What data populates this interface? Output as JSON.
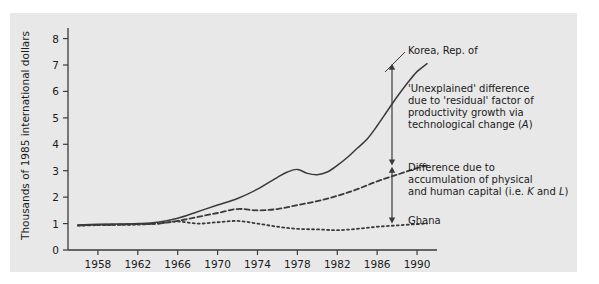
{
  "figure": {
    "background": "#ffffff",
    "panel_color": "#e8e8e8",
    "line_color": "#3a3a3a"
  },
  "chart_data": {
    "type": "line",
    "title": "",
    "xlabel": "",
    "ylabel": "Thousands of 1985 international dollars",
    "xlim": [
      1955,
      1992
    ],
    "ylim": [
      0,
      8.4
    ],
    "xticks": [
      "1958",
      "1962",
      "1966",
      "1970",
      "1974",
      "1978",
      "1982",
      "1986",
      "1990"
    ],
    "xtick_values": [
      1958,
      1962,
      1966,
      1970,
      1974,
      1978,
      1982,
      1986,
      1990
    ],
    "yticks": [
      "0",
      "1",
      "2",
      "3",
      "4",
      "5",
      "6",
      "7",
      "8"
    ],
    "ytick_values": [
      0,
      1,
      2,
      3,
      4,
      5,
      6,
      7,
      8
    ],
    "grid": false,
    "legend_position": "inline-right-annotations",
    "series": [
      {
        "name": "Korea, Rep. of",
        "style": "solid",
        "x": [
          1956,
          1958,
          1960,
          1962,
          1964,
          1966,
          1968,
          1970,
          1972,
          1974,
          1976,
          1977,
          1978,
          1979,
          1980,
          1981,
          1982,
          1983,
          1984,
          1985,
          1986,
          1987,
          1988,
          1989,
          1990,
          1991
        ],
        "values": [
          0.95,
          0.97,
          0.98,
          1.0,
          1.05,
          1.2,
          1.45,
          1.7,
          1.95,
          2.3,
          2.75,
          2.95,
          3.05,
          2.9,
          2.85,
          2.95,
          3.2,
          3.5,
          3.85,
          4.2,
          4.7,
          5.25,
          5.8,
          6.3,
          6.75,
          7.05
        ]
      },
      {
        "name": "Difference due to accumulation of physical and human capital",
        "style": "dashed",
        "x": [
          1956,
          1958,
          1960,
          1962,
          1964,
          1966,
          1968,
          1970,
          1972,
          1974,
          1976,
          1978,
          1980,
          1982,
          1984,
          1986,
          1988,
          1990,
          1991
        ],
        "values": [
          0.93,
          0.95,
          0.96,
          0.98,
          1.0,
          1.1,
          1.25,
          1.4,
          1.55,
          1.5,
          1.55,
          1.7,
          1.85,
          2.05,
          2.3,
          2.6,
          2.85,
          3.1,
          3.2
        ]
      },
      {
        "name": "Ghana",
        "style": "dotted",
        "x": [
          1956,
          1958,
          1960,
          1962,
          1964,
          1966,
          1968,
          1970,
          1972,
          1974,
          1976,
          1978,
          1980,
          1982,
          1984,
          1986,
          1988,
          1990,
          1991
        ],
        "values": [
          0.92,
          0.94,
          0.95,
          0.96,
          1.0,
          1.08,
          1.0,
          1.05,
          1.1,
          1.0,
          0.88,
          0.8,
          0.78,
          0.75,
          0.8,
          0.88,
          0.93,
          0.98,
          1.0
        ]
      }
    ],
    "annotations": [
      {
        "name": "korea-label",
        "text": "Korea, Rep. of",
        "lines": [
          "Korea, Rep. of"
        ]
      },
      {
        "name": "unexplained-difference-note",
        "lines": [
          "'Unexplained' difference",
          "due to 'residual' factor of",
          "productivity growth via",
          "technological change (A)"
        ]
      },
      {
        "name": "capital-accumulation-note",
        "lines": [
          "Difference due to",
          "accumulation of physical",
          "and human capital (i.e. K and L)"
        ]
      },
      {
        "name": "ghana-label",
        "lines": [
          "Ghana"
        ]
      }
    ],
    "arrows": [
      {
        "name": "unexplained-difference-arrow",
        "from": 7.05,
        "to": 3.2
      },
      {
        "name": "capital-accumulation-arrow",
        "from": 3.15,
        "to": 1.0
      }
    ]
  }
}
